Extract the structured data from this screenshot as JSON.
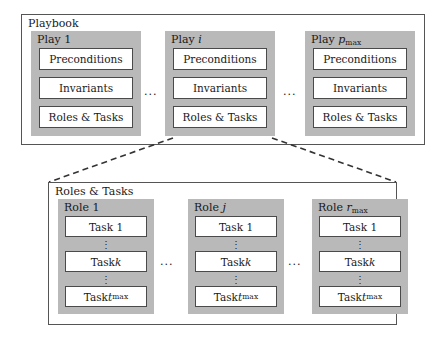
{
  "figure": {
    "kind": "hierarchy-diagram",
    "background": "#ffffff",
    "group_fill": "#b9b9b9",
    "border_color": "#555555",
    "connector_style": "dashed"
  },
  "playbook": {
    "title": "Playbook",
    "plays": [
      {
        "label_prefix": "Play",
        "label_index": "1",
        "index_style": "roman",
        "index_subscript": "",
        "items": [
          "Preconditions",
          "Invariants",
          "Roles & Tasks"
        ]
      },
      {
        "label_prefix": "Play",
        "label_index": "i",
        "index_style": "italic",
        "index_subscript": "",
        "items": [
          "Preconditions",
          "Invariants",
          "Roles & Tasks"
        ]
      },
      {
        "label_prefix": "Play",
        "label_index": "p",
        "index_style": "italic",
        "index_subscript": "max",
        "items": [
          "Preconditions",
          "Invariants",
          "Roles & Tasks"
        ]
      }
    ],
    "separators": [
      "...",
      "..."
    ]
  },
  "roles_and_tasks": {
    "title": "Roles & Tasks",
    "roles": [
      {
        "label_prefix": "Role",
        "label_index": "1",
        "index_style": "roman",
        "index_subscript": "",
        "tasks": [
          {
            "prefix": "Task",
            "index": "1",
            "index_style": "roman",
            "subscript": ""
          },
          {
            "prefix": "Task",
            "index": "k",
            "index_style": "italic",
            "subscript": ""
          },
          {
            "prefix": "Task",
            "index": "t",
            "index_style": "italic",
            "subscript": "max"
          }
        ],
        "task_separators": [
          ":",
          ":"
        ]
      },
      {
        "label_prefix": "Role",
        "label_index": "j",
        "index_style": "italic",
        "index_subscript": "",
        "tasks": [
          {
            "prefix": "Task",
            "index": "1",
            "index_style": "roman",
            "subscript": ""
          },
          {
            "prefix": "Task",
            "index": "k",
            "index_style": "italic",
            "subscript": ""
          },
          {
            "prefix": "Task",
            "index": "t",
            "index_style": "italic",
            "subscript": "max"
          }
        ],
        "task_separators": [
          ":",
          ":"
        ]
      },
      {
        "label_prefix": "Role",
        "label_index": "r",
        "index_style": "italic",
        "index_subscript": "max",
        "tasks": [
          {
            "prefix": "Task",
            "index": "1",
            "index_style": "roman",
            "subscript": ""
          },
          {
            "prefix": "Task",
            "index": "k",
            "index_style": "italic",
            "subscript": ""
          },
          {
            "prefix": "Task",
            "index": "t",
            "index_style": "italic",
            "subscript": "max"
          }
        ],
        "task_separators": [
          ":",
          ":"
        ]
      }
    ],
    "separators": [
      "...",
      "..."
    ]
  }
}
